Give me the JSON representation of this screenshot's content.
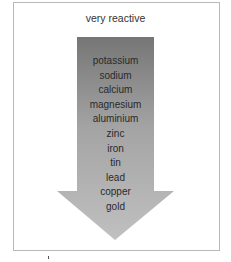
{
  "diagram": {
    "title": "very reactive",
    "type": "reactivity-series-arrow",
    "direction": "top-to-bottom (decreasing reactivity)",
    "colors": {
      "arrow_top": "#7a7a7a",
      "arrow_bottom": "#c2c2c2",
      "frame_border": "#b8b8b8",
      "text": "#2a2a2a"
    },
    "metals": [
      "potassium",
      "sodium",
      "calcium",
      "magnesium",
      "aluminium",
      "zinc",
      "iron",
      "tin",
      "lead",
      "copper",
      "gold"
    ]
  }
}
